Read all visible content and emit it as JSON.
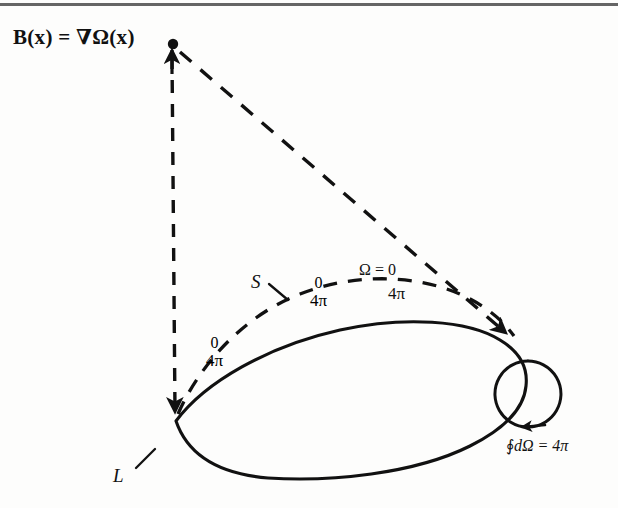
{
  "figure": {
    "kind": "magnetostatics-solid-angle-diagram",
    "title_formula": "B(x) = ∇Ω(x)",
    "labels": {
      "surface": "S",
      "loop": "L",
      "omega_zero": "Ω = 0",
      "flux_integral": "∮dΩ = 4π",
      "flux_integral_symbol": "∮",
      "flux_integral_body": "dΩ = 4π",
      "zero": "0",
      "four_pi": "4π"
    },
    "jump_fractions": [
      {
        "id": "left",
        "numerator": "0",
        "denominator": "4π"
      },
      {
        "id": "mid",
        "numerator": "0",
        "denominator": "4π"
      },
      {
        "id": "right",
        "numerator": "Ω = 0",
        "denominator": "4π"
      }
    ],
    "colors": {
      "ink": "#111111",
      "paper": "#fdfdfc",
      "scan_artifact": "#4a4a4a"
    },
    "geometry": {
      "apex_point": {
        "x": 172,
        "y": 44
      },
      "loop_left_cusp": {
        "x": 175,
        "y": 422
      },
      "small_circle": {
        "cx": 528,
        "cy": 394,
        "r": 33
      },
      "dashed_arrow_tip": {
        "x": 512,
        "y": 338
      }
    }
  }
}
